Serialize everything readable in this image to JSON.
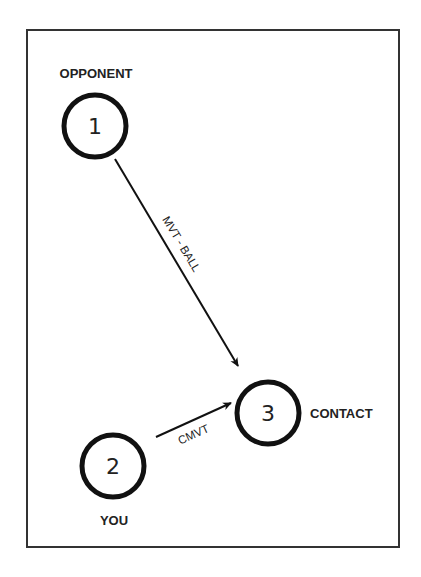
{
  "diagram": {
    "frame": {
      "x": 27,
      "y": 30,
      "width": 372,
      "height": 517,
      "stroke": "#333333"
    },
    "nodes": [
      {
        "id": "1",
        "number": "1",
        "label": "OPPONENT",
        "cx": 95,
        "cy": 126
      },
      {
        "id": "2",
        "number": "2",
        "label": "YOU",
        "cx": 113,
        "cy": 466
      },
      {
        "id": "3",
        "number": "3",
        "label": "CONTACT",
        "cx": 268,
        "cy": 413
      }
    ],
    "edges": [
      {
        "from": "1",
        "to": "3",
        "label": "MVT - BALL"
      },
      {
        "from": "2",
        "to": "3",
        "label": "CMVT"
      }
    ],
    "colors": {
      "stroke": "#111111",
      "text": "#222222",
      "background": "#ffffff"
    }
  }
}
